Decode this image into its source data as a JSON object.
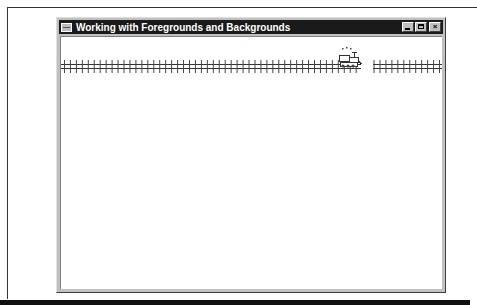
{
  "window": {
    "title": "Working with Foregrounds and Backgrounds",
    "buttons": {
      "minimize": "minimize-button",
      "maximize": "maximize-button",
      "close": "close-button"
    }
  },
  "icons": {
    "system_menu": "system-menu-icon",
    "close_glyph": "×"
  },
  "scene": {
    "track": "railroad-track",
    "sprite": "steam-locomotive"
  },
  "colors": {
    "titlebar": "#1a1a1a",
    "title_text": "#ffffff",
    "client_bg": "#ffffff",
    "chrome": "#c0c0c0"
  }
}
